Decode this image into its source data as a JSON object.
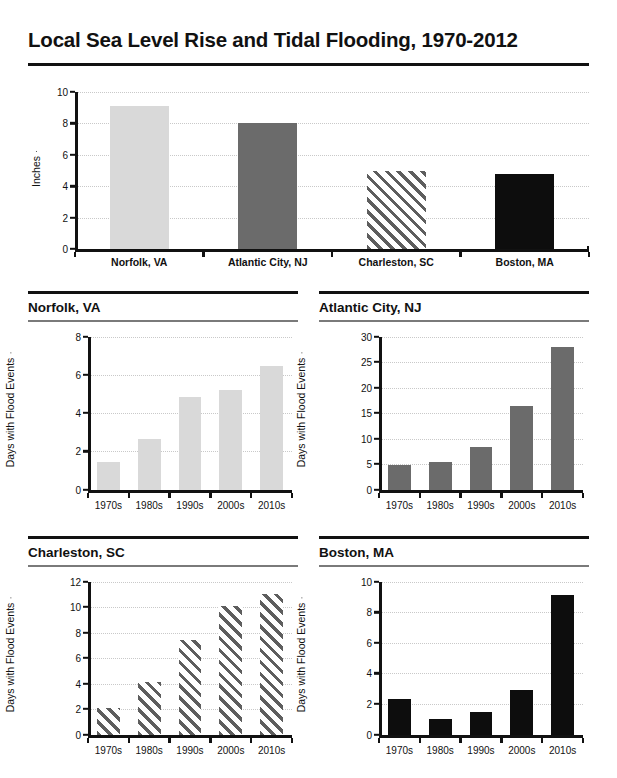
{
  "title": "Local Sea Level Rise and Tidal Flooding, 1970-2012",
  "colors": {
    "light_gray": "#d9d9d9",
    "dark_gray": "#6b6b6b",
    "hatched": "#5e5e5e",
    "black": "#0d0d0d",
    "gridline": "#c9c9c9",
    "axis": "#111111"
  },
  "chart_data": [
    {
      "id": "sea-level-rise",
      "type": "bar",
      "title": "",
      "xlabel": "",
      "ylabel": "Inches",
      "ylim": [
        0,
        10
      ],
      "yticks": [
        0,
        2,
        4,
        6,
        8,
        10
      ],
      "grid": true,
      "categories": [
        "Norfolk, VA",
        "Atlantic City, NJ",
        "Charleston, SC",
        "Boston, MA"
      ],
      "values": [
        9.1,
        8.0,
        5.0,
        4.75
      ],
      "styles": [
        "light",
        "dark",
        "hatch",
        "black"
      ]
    },
    {
      "id": "norfolk",
      "type": "bar",
      "title": "Norfolk, VA",
      "xlabel": "",
      "ylabel": "Days with Flood Events",
      "ylim": [
        0,
        8
      ],
      "yticks": [
        0,
        2,
        4,
        6,
        8
      ],
      "grid": true,
      "categories": [
        "1970s",
        "1980s",
        "1990s",
        "2000s",
        "2010s"
      ],
      "values": [
        1.45,
        2.65,
        4.85,
        5.2,
        6.45
      ],
      "style": "light"
    },
    {
      "id": "atlantic-city",
      "type": "bar",
      "title": "Atlantic City, NJ",
      "xlabel": "",
      "ylabel": "Days with Flood Events",
      "ylim": [
        0,
        30
      ],
      "yticks": [
        0,
        5,
        10,
        15,
        20,
        25,
        30
      ],
      "grid": true,
      "categories": [
        "1970s",
        "1980s",
        "1990s",
        "2000s",
        "2010s"
      ],
      "values": [
        4.8,
        5.4,
        8.3,
        16.3,
        27.9
      ],
      "style": "dark"
    },
    {
      "id": "charleston",
      "type": "bar",
      "title": "Charleston, SC",
      "xlabel": "",
      "ylabel": "Days with Flood Events",
      "ylim": [
        0,
        12
      ],
      "yticks": [
        0,
        2,
        4,
        6,
        8,
        10,
        12
      ],
      "grid": true,
      "categories": [
        "1970s",
        "1980s",
        "1990s",
        "2000s",
        "2010s"
      ],
      "values": [
        2.1,
        4.1,
        7.4,
        10.1,
        11.0
      ],
      "style": "hatch"
    },
    {
      "id": "boston",
      "type": "bar",
      "title": "Boston, MA",
      "xlabel": "",
      "ylabel": "Days with Flood Events",
      "ylim": [
        0,
        10
      ],
      "yticks": [
        0,
        2,
        4,
        6,
        8,
        10
      ],
      "grid": true,
      "categories": [
        "1970s",
        "1980s",
        "1990s",
        "2000s",
        "2010s"
      ],
      "values": [
        2.3,
        1.05,
        1.5,
        2.9,
        9.1
      ],
      "style": "black"
    }
  ]
}
